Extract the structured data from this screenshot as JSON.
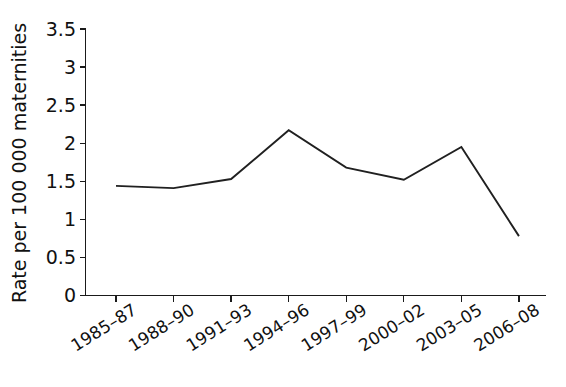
{
  "chart_data": {
    "type": "line",
    "title": "",
    "xlabel": "",
    "ylabel": "Rate per 100 000 maternities",
    "categories": [
      "1985–87",
      "1988–90",
      "1991–93",
      "1994–96",
      "1997–99",
      "2000–02",
      "2003–05",
      "2006–08"
    ],
    "values": [
      1.44,
      1.41,
      1.53,
      2.17,
      1.68,
      1.52,
      1.95,
      0.78
    ],
    "series": [
      {
        "name": "Rate per 100 000 maternities",
        "values": [
          1.44,
          1.41,
          1.53,
          2.17,
          1.68,
          1.52,
          1.95,
          0.78
        ]
      }
    ],
    "ylim": [
      0,
      3.5
    ],
    "ytick_labels": [
      "0",
      "0.5",
      "1",
      "1.5",
      "2",
      "2.5",
      "3",
      "3.5"
    ],
    "ytick_values": [
      0,
      0.5,
      1,
      1.5,
      2,
      2.5,
      3,
      3.5
    ],
    "grid": false,
    "legend": false,
    "line_color": "#202020",
    "axis_color": "#1a1a1a",
    "background_color": "#ffffff"
  }
}
